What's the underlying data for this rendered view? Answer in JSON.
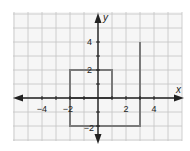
{
  "chart_data": {
    "type": "line",
    "title": "",
    "xlabel": "x",
    "ylabel": "y",
    "xlim": [
      -6,
      6
    ],
    "ylim": [
      -3,
      6
    ],
    "grid": true,
    "x_tick_labels": [
      "-4",
      "-2",
      "2",
      "4"
    ],
    "x_tick_values": [
      -4,
      -2,
      2,
      4
    ],
    "y_tick_labels": [
      "4",
      "2",
      "-2"
    ],
    "y_tick_values": [
      4,
      2,
      -2
    ],
    "series": [
      {
        "name": "rectangle",
        "points": [
          [
            -2,
            0
          ],
          [
            -2,
            2
          ],
          [
            1,
            2
          ],
          [
            1,
            0
          ],
          [
            -2,
            0
          ]
        ]
      },
      {
        "name": "path",
        "points": [
          [
            -2,
            0
          ],
          [
            -2,
            -2
          ],
          [
            3,
            -2
          ],
          [
            3,
            4
          ]
        ]
      }
    ],
    "line_color": "#7a7a7a"
  },
  "labels": {
    "x_axis": "x",
    "y_axis": "y",
    "xt_m4": "−4",
    "xt_m2": "−2",
    "xt_2": "2",
    "xt_4": "4",
    "yt_4": "4",
    "yt_2": "2",
    "yt_m2": "−2"
  }
}
